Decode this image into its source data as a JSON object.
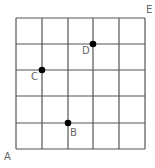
{
  "diagram": {
    "grid": {
      "cols": 5,
      "rows": 5,
      "line_color": "#555555",
      "x_lines": [
        16,
        42,
        68,
        93,
        119,
        145
      ],
      "y_lines": [
        18,
        44,
        70,
        96,
        123,
        149
      ]
    },
    "corners": [
      {
        "label": "A",
        "x": 4,
        "y": 160
      },
      {
        "label": "E",
        "x": 146,
        "y": 13
      }
    ],
    "points": [
      {
        "label": "B",
        "x": 68,
        "y": 123,
        "label_x": 70,
        "label_y": 136
      },
      {
        "label": "C",
        "x": 42,
        "y": 70,
        "label_x": 31,
        "label_y": 80
      },
      {
        "label": "D",
        "x": 93,
        "y": 44,
        "label_x": 82,
        "label_y": 54
      }
    ],
    "dot_color": "#000000"
  }
}
